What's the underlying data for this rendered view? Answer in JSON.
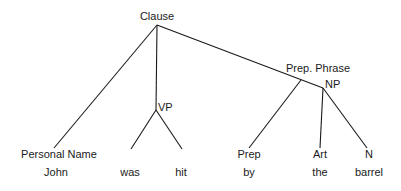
{
  "diagram": {
    "type": "parse-tree",
    "nodes": {
      "root": "Clause",
      "vp": "VP",
      "prep_phrase": "Prep. Phrase",
      "np": "NP",
      "personal_name": "Personal Name",
      "prep": "Prep",
      "art": "Art",
      "n": "N"
    },
    "words": {
      "john": "John",
      "was": "was",
      "hit": "hit",
      "by": "by",
      "the": "the",
      "barrel": "barrel"
    },
    "edges": [
      [
        "Clause",
        "Personal Name"
      ],
      [
        "Clause",
        "VP"
      ],
      [
        "Clause",
        "Prep. Phrase"
      ],
      [
        "VP",
        "was"
      ],
      [
        "VP",
        "hit"
      ],
      [
        "Prep. Phrase",
        "Prep"
      ],
      [
        "Prep. Phrase",
        "NP"
      ],
      [
        "NP",
        "Art"
      ],
      [
        "NP",
        "N"
      ]
    ],
    "line_color": "#1a1a1a"
  }
}
